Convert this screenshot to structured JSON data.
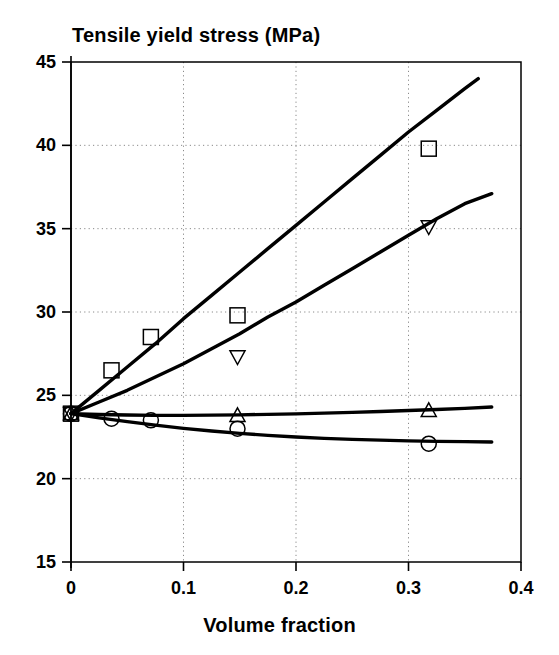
{
  "chart_data": {
    "type": "line",
    "title": "Tensile yield stress (MPa)",
    "xlabel": "Volume fraction",
    "ylabel": "Tensile yield stress (MPa)",
    "xlim": [
      0,
      0.4
    ],
    "ylim": [
      15,
      45
    ],
    "xticks": [
      0,
      0.1,
      0.2,
      0.3,
      0.4
    ],
    "xtick_labels": [
      "0",
      "0.1",
      "0.2",
      "0.3",
      "0.4"
    ],
    "yticks": [
      15,
      20,
      25,
      30,
      35,
      40,
      45
    ],
    "ytick_labels": [
      "15",
      "20",
      "25",
      "30",
      "35",
      "40",
      "45"
    ],
    "grid": "dotted-both",
    "legend": "none",
    "line_color": "#000000",
    "marker_color": "#000000",
    "background_color": "#ffffff",
    "axis_color": "#000000",
    "series": [
      {
        "name": "upper-curve-squares",
        "marker": "square",
        "curve": [
          [
            0.0,
            23.9
          ],
          [
            0.025,
            25.3
          ],
          [
            0.05,
            26.7
          ],
          [
            0.075,
            28.1
          ],
          [
            0.1,
            29.6
          ],
          [
            0.125,
            31.0
          ],
          [
            0.15,
            32.4
          ],
          [
            0.175,
            33.8
          ],
          [
            0.2,
            35.2
          ],
          [
            0.225,
            36.6
          ],
          [
            0.25,
            38.0
          ],
          [
            0.275,
            39.4
          ],
          [
            0.3,
            40.8
          ],
          [
            0.325,
            42.1
          ],
          [
            0.35,
            43.4
          ],
          [
            0.362,
            44.0
          ]
        ],
        "points": [
          [
            0.0,
            23.9
          ],
          [
            0.036,
            26.5
          ],
          [
            0.071,
            28.5
          ],
          [
            0.148,
            29.8
          ],
          [
            0.318,
            39.8
          ]
        ]
      },
      {
        "name": "second-curve-down-triangles",
        "marker": "triangle-down",
        "curve": [
          [
            0.0,
            23.9
          ],
          [
            0.025,
            24.6
          ],
          [
            0.05,
            25.3
          ],
          [
            0.075,
            26.1
          ],
          [
            0.1,
            26.9
          ],
          [
            0.125,
            27.8
          ],
          [
            0.15,
            28.7
          ],
          [
            0.175,
            29.7
          ],
          [
            0.2,
            30.6
          ],
          [
            0.225,
            31.6
          ],
          [
            0.25,
            32.6
          ],
          [
            0.275,
            33.6
          ],
          [
            0.3,
            34.6
          ],
          [
            0.325,
            35.6
          ],
          [
            0.35,
            36.5
          ],
          [
            0.374,
            37.1
          ]
        ],
        "points": [
          [
            0.0,
            23.9
          ],
          [
            0.148,
            27.3
          ],
          [
            0.318,
            35.1
          ]
        ]
      },
      {
        "name": "third-curve-up-triangles",
        "marker": "triangle-up",
        "curve": [
          [
            0.0,
            23.9
          ],
          [
            0.025,
            23.85
          ],
          [
            0.05,
            23.82
          ],
          [
            0.075,
            23.8
          ],
          [
            0.1,
            23.8
          ],
          [
            0.125,
            23.81
          ],
          [
            0.15,
            23.83
          ],
          [
            0.175,
            23.86
          ],
          [
            0.2,
            23.89
          ],
          [
            0.225,
            23.93
          ],
          [
            0.25,
            23.98
          ],
          [
            0.275,
            24.03
          ],
          [
            0.3,
            24.09
          ],
          [
            0.325,
            24.15
          ],
          [
            0.35,
            24.22
          ],
          [
            0.374,
            24.3
          ]
        ],
        "points": [
          [
            0.0,
            23.9
          ],
          [
            0.148,
            23.8
          ],
          [
            0.318,
            24.1
          ]
        ]
      },
      {
        "name": "lower-curve-circles",
        "marker": "circle",
        "curve": [
          [
            0.0,
            23.9
          ],
          [
            0.025,
            23.65
          ],
          [
            0.05,
            23.42
          ],
          [
            0.075,
            23.21
          ],
          [
            0.1,
            23.02
          ],
          [
            0.125,
            22.86
          ],
          [
            0.15,
            22.72
          ],
          [
            0.175,
            22.6
          ],
          [
            0.2,
            22.5
          ],
          [
            0.225,
            22.42
          ],
          [
            0.25,
            22.36
          ],
          [
            0.275,
            22.31
          ],
          [
            0.3,
            22.27
          ],
          [
            0.325,
            22.24
          ],
          [
            0.35,
            22.22
          ],
          [
            0.374,
            22.2
          ]
        ],
        "points": [
          [
            0.0,
            23.9
          ],
          [
            0.036,
            23.6
          ],
          [
            0.071,
            23.5
          ],
          [
            0.148,
            23.0
          ],
          [
            0.318,
            22.1
          ]
        ]
      }
    ]
  }
}
